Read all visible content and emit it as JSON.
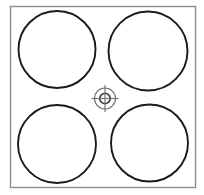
{
  "canvas": {
    "width": 204,
    "height": 195,
    "background_color": "#ffffff",
    "title": "Four-circle layout with center registration target"
  },
  "colors": {
    "frame_stroke": "#8d8d8d",
    "circle_stroke": "#1a1a1a",
    "target_stroke": "#6e6e6e",
    "target_inner_stroke": "#4a4a4a",
    "background": "#ffffff"
  },
  "frame": {
    "name": "outer-square-frame",
    "x": 10.5,
    "y": 6.5,
    "width": 185,
    "height": 181,
    "stroke_width": 1.4
  },
  "circles": [
    {
      "id": "circle-top-left",
      "label": "Top left circle",
      "cx": 57,
      "cy": 49.5,
      "r": 38.5,
      "stroke_width": 1.9
    },
    {
      "id": "circle-top-right",
      "label": "Top right circle",
      "cx": 148,
      "cy": 51,
      "r": 39.5,
      "stroke_width": 1.9
    },
    {
      "id": "circle-bottom-left",
      "label": "Bottom left circle",
      "cx": 57,
      "cy": 144,
      "r": 39,
      "stroke_width": 1.9
    },
    {
      "id": "circle-bottom-right",
      "label": "Bottom right circle",
      "cx": 149.5,
      "cy": 143,
      "r": 38.5,
      "stroke_width": 1.9
    }
  ],
  "target": {
    "id": "center-registration-target",
    "label": "Center registration crosshair target",
    "cx": 105,
    "cy": 98.5,
    "outer_r": 10.5,
    "inner_r": 5.2,
    "arm_length": 13.5,
    "stroke_width_outer": 1.1,
    "stroke_width_inner": 1.8
  }
}
